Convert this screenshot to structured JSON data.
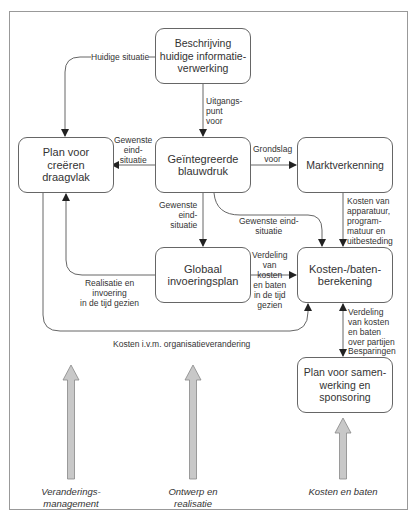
{
  "boxes": {
    "beschrijving": "Beschrijving\nhuidige informatie-\nverwerking",
    "plan_draagvlak": "Plan voor\ncreëren\ndraagvlak",
    "blauwdruk": "Geïntegreerde\nblauwdruk",
    "marktverkenning": "Marktverkenning",
    "globaal": "Globaal\ninvoeringsplan",
    "kosten_baten": "Kosten-/baten-\nberekening",
    "samenwerking": "Plan voor samen-\nwerking en\nsponsoring"
  },
  "labels": {
    "huidige_situatie": "Huidige situatie",
    "uitgangspunt": "Uitgangs-\npunt\nvoor",
    "gewenste_1": "Gewenste\neind-\nsituatie",
    "grondslag": "Grondslag\nvoor",
    "gewenste_2": "Gewenste\neind-\nsituatie",
    "gewenste_3": "Gewenste eind-\nsituatie",
    "kosten_apparatuur": "Kosten van\napparatuur,\nprogram-\nmatuur en\nuitbesteding",
    "realisatie": "Realisatie en\ninvoering\nin de tijd gezien",
    "verdeling_tijd": "Verdeling\nvan\nkosten\nen baten\nin de tijd\ngezien",
    "kosten_org": "Kosten i.v.m. organisatieverandering",
    "verdeling_partijen": "Verdeling\nvan kosten\nen baten\nover partijen",
    "besparingen": "Besparingen"
  },
  "pillars": {
    "veranderingsmanagement": "Veranderings-\nmanagement",
    "ontwerp": "Ontwerp en\nrealisatie",
    "kosten_en_baten": "Kosten en baten"
  },
  "colors": {
    "line": "#555555",
    "pillar_fill": "#c8c8c8",
    "pillar_stroke": "#888888",
    "frame": "#999999"
  }
}
